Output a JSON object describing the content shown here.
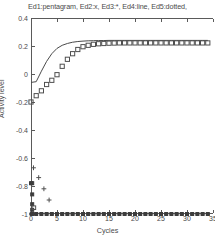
{
  "chart_data": {
    "type": "line",
    "title": "Ed1:pentagram, Ed2:x, Ed3:*, Ed4:line, Ed5:dotted,",
    "xlabel": "Cycles",
    "ylabel": "Activity level",
    "xlim": [
      0,
      35
    ],
    "ylim": [
      -1,
      0.4
    ],
    "grid": false,
    "legend_position": "none",
    "xticks": [
      0,
      5,
      10,
      15,
      20,
      25,
      30,
      35
    ],
    "xtick_labels": [
      "0",
      "5",
      "10",
      "15",
      "20",
      "25",
      "30",
      "35"
    ],
    "yticks": [
      0.4,
      0.2,
      0,
      -0.2,
      -0.4,
      -0.6,
      -0.8,
      -1
    ],
    "ytick_labels": [
      "0.4",
      "0.2",
      "0",
      "-0.2",
      "-0.4",
      "-0.6",
      "-0.8",
      "-1"
    ],
    "x": [
      0,
      1,
      2,
      3,
      4,
      5,
      6,
      7,
      8,
      9,
      10,
      11,
      12,
      13,
      14,
      15,
      16,
      17,
      18,
      19,
      20,
      21,
      22,
      23,
      24,
      25,
      26,
      27,
      28,
      29,
      30,
      31,
      32,
      33,
      34
    ],
    "series": [
      {
        "name": "Ed1",
        "marker": "pentagram",
        "style": "markers",
        "values": [
          -0.2,
          -0.155,
          -0.12,
          -0.075,
          -0.045,
          -0.005,
          0.055,
          0.105,
          0.145,
          0.175,
          0.195,
          0.205,
          0.212,
          0.216,
          0.218,
          0.22,
          0.221,
          0.222,
          0.222,
          0.222,
          0.222,
          0.222,
          0.222,
          0.222,
          0.222,
          0.222,
          0.222,
          0.222,
          0.222,
          0.222,
          0.222,
          0.222,
          0.222,
          0.222,
          0.222
        ]
      },
      {
        "name": "Ed2",
        "marker": "x",
        "style": "markers",
        "values": [
          -0.67,
          -0.74,
          -0.82,
          -0.9,
          -1,
          -1,
          -1,
          -1,
          -1,
          -1,
          -1,
          -1,
          -1,
          -1,
          -1,
          -1,
          -1,
          -1,
          -1,
          -1,
          -1,
          -1,
          -1,
          -1,
          -1,
          -1,
          -1,
          -1,
          -1,
          -1,
          -1,
          -1,
          -1,
          -1,
          -1
        ]
      },
      {
        "name": "Ed3",
        "marker": "*",
        "style": "markers",
        "values": [
          -0.78,
          -1,
          -1,
          -1,
          -1,
          -1,
          -1,
          -1,
          -1,
          -1,
          -1,
          -1,
          -1,
          -1,
          -1,
          -1,
          -1,
          -1,
          -1,
          -1,
          -1,
          -1,
          -1,
          -1,
          -1,
          -1,
          -1,
          -1,
          -1,
          -1,
          -1,
          -1,
          -1,
          -1,
          -1
        ]
      },
      {
        "name": "Ed4",
        "marker": "none",
        "style": "line",
        "values": [
          -0.06,
          -0.055,
          0.02,
          0.09,
          0.145,
          0.183,
          0.205,
          0.218,
          0.227,
          0.232,
          0.235,
          0.237,
          0.238,
          0.239,
          0.239,
          0.24,
          0.24,
          0.24,
          0.24,
          0.24,
          0.24,
          0.24,
          0.24,
          0.24,
          0.24,
          0.24,
          0.24,
          0.24,
          0.24,
          0.24,
          0.24,
          0.24,
          0.24,
          0.24,
          0.24
        ]
      },
      {
        "name": "Ed5",
        "marker": "dotted",
        "style": "markers",
        "values": [
          -1,
          -1,
          -1,
          -1,
          -1,
          -1,
          -1,
          -1,
          -1,
          -1,
          -1,
          -1,
          -1,
          -1,
          -1,
          -1,
          -1,
          -1,
          -1,
          -1,
          -1,
          -1,
          -1,
          -1,
          -1,
          -1,
          -1,
          -1,
          -1,
          -1,
          -1,
          -1,
          -1,
          -1,
          -1
        ]
      }
    ],
    "annotations": {
      "axis_cluster_x0": [
        -0.78,
        -0.86,
        -0.93,
        -0.97,
        -1
      ]
    }
  }
}
